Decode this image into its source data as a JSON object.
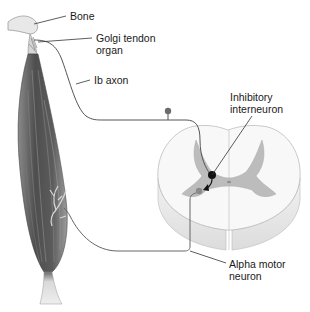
{
  "diagram": {
    "type": "anatomical-reflex-pathway",
    "labels": {
      "bone": {
        "lines": [
          "Bone"
        ]
      },
      "golgi_tendon_organ": {
        "lines": [
          "Golgi tendon",
          "organ"
        ]
      },
      "ib_axon": {
        "lines": [
          "Ib axon"
        ]
      },
      "inhibitory_interneuron": {
        "lines": [
          "Inhibitory",
          "interneuron"
        ]
      },
      "alpha_motor_neuron": {
        "lines": [
          "Alpha motor",
          "neuron"
        ]
      }
    },
    "colors": {
      "muscle_dark": "#4a4a4a",
      "muscle_light": "#9a9a9a",
      "tendon": "#e6e6e6",
      "spinal_white_matter": "#f7f7f7",
      "spinal_gray_matter": "#b8b8b8",
      "nerve_line": "#555555",
      "interneuron": "#111111",
      "leader_line": "#333333"
    }
  }
}
